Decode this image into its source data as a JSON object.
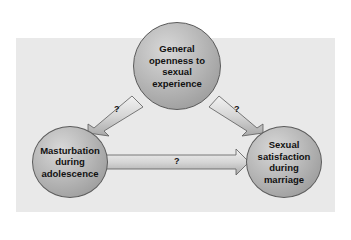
{
  "diagram": {
    "nodes": {
      "top": {
        "lines": [
          "General",
          "openness to",
          "sexual",
          "experience"
        ]
      },
      "left": {
        "lines": [
          "Masturbation",
          "during",
          "adolescence"
        ]
      },
      "right": {
        "lines": [
          "Sexual",
          "satisfaction",
          "during",
          "marriage"
        ]
      }
    },
    "edges": [
      {
        "from": "top",
        "to": "left",
        "label": "?"
      },
      {
        "from": "top",
        "to": "right",
        "label": "?"
      },
      {
        "from": "left",
        "to": "right",
        "label": "?"
      }
    ],
    "colors": {
      "background_panel": "#e9e9e9",
      "node_fill": "#b8b8b8",
      "arrow_fill": "#c8c8c8",
      "outline": "#5a5a5a"
    }
  }
}
